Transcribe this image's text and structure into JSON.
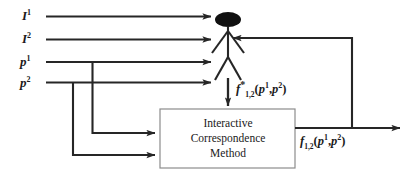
{
  "diagram": {
    "type": "flow-diagram",
    "title_visible": false,
    "colors": {
      "line": "#262626",
      "box_border": "#8c8c8c",
      "text": "#1a1a1a",
      "background": "#ffffff",
      "figure_head_fill": "#111111"
    },
    "inputs": [
      {
        "id": "image-1",
        "base": "I",
        "superscript": "1"
      },
      {
        "id": "image-2",
        "base": "I",
        "superscript": "2"
      },
      {
        "id": "points-1",
        "base": "p",
        "superscript": "1"
      },
      {
        "id": "points-2",
        "base": "p",
        "superscript": "2"
      }
    ],
    "actor": {
      "name": "human-operator",
      "shape": "stick-figure"
    },
    "process_box": {
      "lines": [
        "Interactive",
        "Correspondence",
        "Method"
      ]
    },
    "labels": {
      "human_output": {
        "base": "f",
        "star": "*",
        "subscript": "1,2",
        "open": "(",
        "arg1_base": "p",
        "arg1_sup": "1",
        "comma": ",",
        "arg2_base": "p",
        "arg2_sup": "2",
        "close": ")"
      },
      "method_output": {
        "base": "f",
        "subscript": "1,2",
        "open": "(",
        "arg1_base": "p",
        "arg1_sup": "1",
        "comma": ",",
        "arg2_base": "p",
        "arg2_sup": "2",
        "close": ")"
      }
    }
  }
}
